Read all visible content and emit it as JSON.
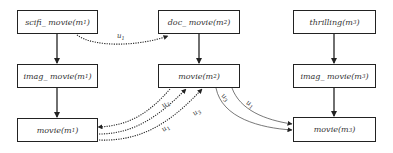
{
  "diagram": {
    "nodes": [
      {
        "id": "scifi_movie_m1",
        "pred": "scifi_ movie",
        "arg": "m",
        "idx": "1"
      },
      {
        "id": "imag_movie_m1",
        "pred": "imag_ movie",
        "arg": "m",
        "idx": "1"
      },
      {
        "id": "movie_m1",
        "pred": "movie",
        "arg": "m",
        "idx": "1"
      },
      {
        "id": "doc_movie_m2",
        "pred": "doc_ movie",
        "arg": "m",
        "idx": "2"
      },
      {
        "id": "movie_m2",
        "pred": "movie",
        "arg": "m",
        "idx": "2"
      },
      {
        "id": "thrilling_m3",
        "pred": "thrilling",
        "arg": "m",
        "idx": "3"
      },
      {
        "id": "imag_movie_m3",
        "pred": "imag_ movie",
        "arg": "m",
        "idx": "3"
      },
      {
        "id": "movie_m3",
        "pred": "movie",
        "arg": "m",
        "idx": "3"
      }
    ],
    "edges": [
      {
        "from": "scifi_movie_m1",
        "to": "imag_movie_m1",
        "style": "solid",
        "label": ""
      },
      {
        "from": "imag_movie_m1",
        "to": "movie_m1",
        "style": "solid",
        "label": ""
      },
      {
        "from": "doc_movie_m2",
        "to": "movie_m2",
        "style": "solid",
        "label": ""
      },
      {
        "from": "thrilling_m3",
        "to": "imag_movie_m3",
        "style": "solid",
        "label": ""
      },
      {
        "from": "imag_movie_m3",
        "to": "movie_m3",
        "style": "solid",
        "label": ""
      },
      {
        "from": "scifi_movie_m1",
        "to": "doc_movie_m2",
        "style": "dotted",
        "label": "u1"
      },
      {
        "from": "movie_m2",
        "to": "movie_m1",
        "style": "dotted",
        "label": "u2"
      },
      {
        "from": "movie_m1",
        "to": "movie_m2",
        "style": "dotted",
        "label": "u1"
      },
      {
        "from": "movie_m1",
        "to": "movie_m2",
        "style": "dotted",
        "label": "u3"
      },
      {
        "from": "movie_m2",
        "to": "movie_m3",
        "style": "thin-solid",
        "label": "u3"
      },
      {
        "from": "movie_m2",
        "to": "movie_m3",
        "style": "thin-solid",
        "label": "u1"
      }
    ],
    "edge_labels": [
      {
        "base": "u",
        "idx": "1"
      },
      {
        "base": "u",
        "idx": "2"
      },
      {
        "base": "u",
        "idx": "1"
      },
      {
        "base": "u",
        "idx": "3"
      },
      {
        "base": "u",
        "idx": "3"
      },
      {
        "base": "u",
        "idx": "1"
      }
    ],
    "colors": {
      "stroke": "#222222",
      "text": "#333333",
      "background": "#ffffff"
    }
  }
}
